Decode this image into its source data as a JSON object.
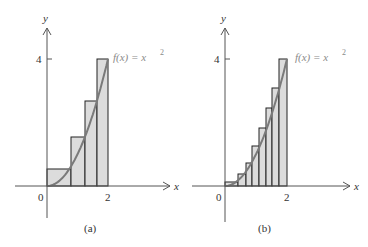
{
  "figure": {
    "function_label": "f(x) = x",
    "function_exp": "2",
    "axis_x_label": "x",
    "axis_y_label": "y",
    "tick_origin": "0",
    "tick_x": "2",
    "tick_y": "4",
    "colors": {
      "fill": "#dcdcdc",
      "curve": "#7a7a7a",
      "stroke": "#222222",
      "axis": "#555555"
    }
  },
  "panels": [
    {
      "caption": "(a)",
      "origin": [
        47,
        186
      ],
      "x_axis_range_px": [
        15,
        170
      ],
      "y_axis_range_px": [
        8,
        218
      ],
      "px_at_x2": 108,
      "px_at_y4": 59,
      "edges": [
        47,
        71,
        85,
        97,
        108
      ],
      "tops": [
        169,
        137,
        101,
        59
      ],
      "label_pos": [
        113,
        57
      ],
      "caption_pos": [
        92,
        229
      ]
    },
    {
      "caption": "(b)",
      "origin": [
        225,
        186
      ],
      "x_axis_range_px": [
        192,
        350
      ],
      "y_axis_range_px": [
        8,
        222
      ],
      "px_at_x2": 287,
      "px_at_y4": 59,
      "edges": [
        225,
        238,
        246,
        252,
        259,
        266,
        272,
        279,
        287
      ],
      "tops": [
        182,
        174,
        163,
        146,
        128,
        108,
        88,
        59
      ],
      "label_pos": [
        295,
        57
      ],
      "caption_pos": [
        266,
        229
      ]
    }
  ],
  "chart_data": [
    {
      "type": "bar",
      "title": "(a) Upper Riemann sum, n = 4",
      "function": "f(x) = x^2",
      "x": [
        0,
        0.5,
        1,
        1.5
      ],
      "widths": 0.5,
      "values": [
        0.25,
        1,
        2.25,
        4
      ],
      "xlabel": "x",
      "ylabel": "y",
      "x_ticks": [
        0,
        2
      ],
      "y_ticks": [
        4
      ],
      "xlim": [
        -1,
        3
      ],
      "ylim": [
        -1,
        5
      ],
      "grid": false
    },
    {
      "type": "bar",
      "title": "(b) Upper Riemann sum, n = 8",
      "function": "f(x) = x^2",
      "x": [
        0,
        0.25,
        0.5,
        0.75,
        1,
        1.25,
        1.5,
        1.75
      ],
      "widths": 0.25,
      "values": [
        0.0625,
        0.25,
        0.5625,
        1,
        1.5625,
        2.25,
        3.0625,
        4
      ],
      "xlabel": "x",
      "ylabel": "y",
      "x_ticks": [
        0,
        2
      ],
      "y_ticks": [
        4
      ],
      "xlim": [
        -1,
        3
      ],
      "ylim": [
        -1,
        5
      ],
      "grid": false
    }
  ]
}
